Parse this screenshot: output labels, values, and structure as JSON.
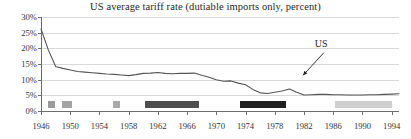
{
  "chart_data": {
    "type": "line",
    "title": "US average tariff rate (dutiable imports only, percent)",
    "xlabel": "",
    "ylabel": "",
    "xlim": [
      1946,
      1995
    ],
    "ylim": [
      0,
      30
    ],
    "grid": true,
    "legend_position": "none",
    "y_ticks": [
      "0%",
      "5%",
      "10%",
      "15%",
      "20%",
      "25%",
      "30%"
    ],
    "y_tick_values": [
      0,
      5,
      10,
      15,
      20,
      25,
      30
    ],
    "x_ticks": [
      "1946",
      "1950",
      "1954",
      "1958",
      "1962",
      "1966",
      "1970",
      "1974",
      "1978",
      "1982",
      "1986",
      "1990",
      "1994"
    ],
    "x_tick_values": [
      1946,
      1950,
      1954,
      1958,
      1962,
      1966,
      1970,
      1974,
      1978,
      1982,
      1986,
      1990,
      1994
    ],
    "series": [
      {
        "name": "US",
        "color": "#555555",
        "x": [
          1946,
          1947,
          1948,
          1949,
          1950,
          1951,
          1952,
          1953,
          1954,
          1955,
          1956,
          1957,
          1958,
          1959,
          1960,
          1961,
          1962,
          1963,
          1964,
          1965,
          1966,
          1967,
          1968,
          1969,
          1970,
          1971,
          1972,
          1973,
          1974,
          1975,
          1976,
          1977,
          1978,
          1979,
          1980,
          1981,
          1982,
          1983,
          1984,
          1985,
          1986,
          1987,
          1988,
          1989,
          1990,
          1991,
          1992,
          1993,
          1994,
          1995
        ],
        "values": [
          26.2,
          19.5,
          14.2,
          13.6,
          13.1,
          12.6,
          12.4,
          12.2,
          12.0,
          11.8,
          11.7,
          11.5,
          11.3,
          11.6,
          12.0,
          12.1,
          12.3,
          12.0,
          11.9,
          12.0,
          12.0,
          12.1,
          11.4,
          10.8,
          10.0,
          9.5,
          9.6,
          8.9,
          8.4,
          6.9,
          5.8,
          5.6,
          6.0,
          6.4,
          7.0,
          6.0,
          5.1,
          5.2,
          5.3,
          5.3,
          5.2,
          5.2,
          5.1,
          5.1,
          5.1,
          5.2,
          5.2,
          5.3,
          5.4,
          5.5
        ]
      }
    ],
    "annotations": [
      {
        "text": "US",
        "x": 1981,
        "y": 5.1,
        "label_left_pct": 76.5,
        "label_top_pct": 22.0,
        "arrow_from_pct": [
          79.0,
          38.0
        ],
        "arrow_to_pct": [
          73.2,
          62.0
        ]
      }
    ],
    "baseline_bars": [
      {
        "name": "geneva-1947",
        "start": 1947.0,
        "end": 1947.9,
        "color": "#9a9a9a"
      },
      {
        "name": "annecy-1949",
        "start": 1948.9,
        "end": 1950.3,
        "color": "#a3a3a3"
      },
      {
        "name": "geneva-1956",
        "start": 1955.9,
        "end": 1956.8,
        "color": "#a9a9a9"
      },
      {
        "name": "dillon-kennedy-round",
        "start": 1960.3,
        "end": 1967.6,
        "color": "#4e4e4e"
      },
      {
        "name": "tokyo-round",
        "start": 1973.2,
        "end": 1979.6,
        "color": "#1f1f1f"
      },
      {
        "name": "uruguay-round",
        "start": 1986.2,
        "end": 1994.0,
        "color": "#cfcfcf"
      }
    ]
  }
}
